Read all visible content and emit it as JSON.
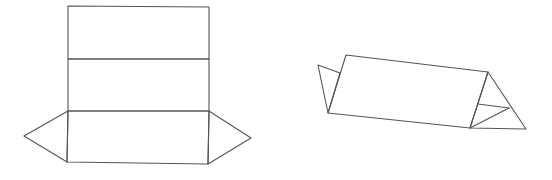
{
  "diagram": {
    "stroke_color": "#555555",
    "background": "#ffffff",
    "figures": [
      {
        "name": "prism-net",
        "rectangles": [
          {
            "name": "net-face-top",
            "points": [
              [
                68,
                6
              ],
              [
                209,
                7
              ],
              [
                209,
                59
              ],
              [
                68,
                59
              ]
            ]
          },
          {
            "name": "net-face-middle",
            "points": [
              [
                68,
                59
              ],
              [
                209,
                59
              ],
              [
                209,
                111
              ],
              [
                68,
                111
              ]
            ]
          },
          {
            "name": "net-face-bottom",
            "points": [
              [
                68,
                111
              ],
              [
                209,
                111
              ],
              [
                208,
                164
              ],
              [
                67,
                162
              ]
            ]
          }
        ],
        "triangles": [
          {
            "name": "net-left-triangle",
            "points": [
              [
                68,
                111
              ],
              [
                24,
                136
              ],
              [
                67,
                162
              ]
            ]
          },
          {
            "name": "net-right-triangle",
            "points": [
              [
                209,
                111
              ],
              [
                251,
                138
              ],
              [
                208,
                164
              ]
            ]
          }
        ]
      },
      {
        "name": "folded-prism",
        "polygons": [
          {
            "name": "prism-front-face",
            "points": [
              [
                346,
                55
              ],
              [
                488,
                72
              ],
              [
                470,
                128
              ],
              [
                328,
                113
              ]
            ]
          },
          {
            "name": "prism-left-flap",
            "points": [
              [
                340,
                73
              ],
              [
                318,
                65
              ],
              [
                328,
                113
              ]
            ]
          },
          {
            "name": "prism-right-triangle",
            "points": [
              [
                488,
                72
              ],
              [
                526,
                129
              ],
              [
                470,
                128
              ]
            ]
          }
        ],
        "lines": [
          {
            "name": "prism-right-inner-edge-1",
            "points": [
              [
                478,
                104
              ],
              [
                509,
                108
              ]
            ]
          },
          {
            "name": "prism-right-inner-edge-2",
            "points": [
              [
                470,
                128
              ],
              [
                509,
                108
              ]
            ]
          }
        ]
      }
    ]
  }
}
